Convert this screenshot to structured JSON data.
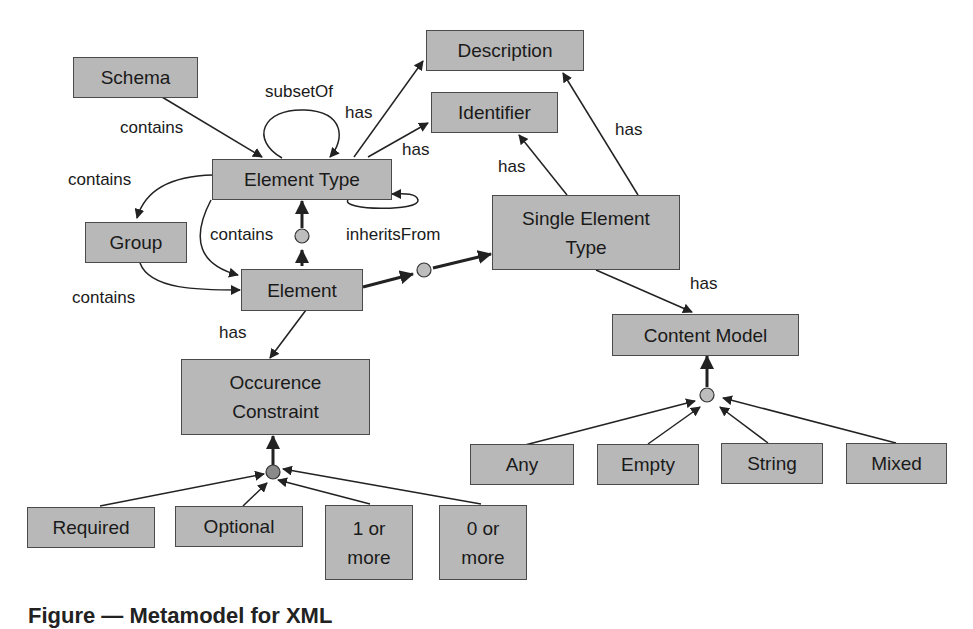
{
  "diagram": {
    "nodes": {
      "schema": "Schema",
      "description": "Description",
      "identifier": "Identifier",
      "element_type": "Element Type",
      "group": "Group",
      "element": "Element",
      "single_element_type_l1": "Single Element",
      "single_element_type_l2": "Type",
      "content_model": "Content Model",
      "occurence_constraint_l1": "Occurence",
      "occurence_constraint_l2": "Constraint",
      "any": "Any",
      "empty": "Empty",
      "string": "String",
      "mixed": "Mixed",
      "required": "Required",
      "optional": "Optional",
      "one_or_more_l1": "1 or",
      "one_or_more_l2": "more",
      "zero_or_more_l1": "0 or",
      "zero_or_more_l2": "more"
    },
    "edge_labels": {
      "schema_contains": "contains",
      "subset_of": "subsetOf",
      "et_has_description": "has",
      "et_has_identifier": "has",
      "et_contains_group": "contains",
      "et_contains_element": "contains",
      "inherits_from": "inheritsFrom",
      "group_contains_element": "contains",
      "element_has_occurence": "has",
      "set_has_identifier": "has",
      "set_has_description": "has",
      "set_has_content_model": "has"
    },
    "colors": {
      "node_fill": "#b8b8b8",
      "node_border": "#4a4a4a",
      "edge": "#222222",
      "junction_fill": "#bdbdbd",
      "junction_dark_fill": "#8a8a8a"
    }
  },
  "caption": "Figure — Metamodel for XML"
}
